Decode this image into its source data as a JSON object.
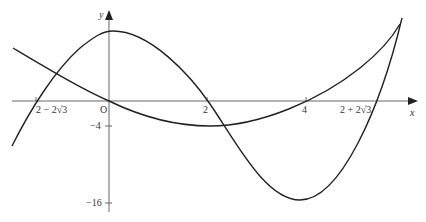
{
  "axes": {
    "x_label": "x",
    "y_label": "y",
    "origin_label": "O",
    "x_ticks": [
      {
        "label": "2 − 2√3",
        "value": -1.464
      },
      {
        "label": "2",
        "value": 2
      },
      {
        "label": "4",
        "value": 4
      },
      {
        "label": "2 + 2√3",
        "value": 5.464
      }
    ],
    "y_ticks": [
      {
        "label": "−4",
        "value": -4
      },
      {
        "label": "−16",
        "value": -16
      }
    ]
  },
  "curves": [
    {
      "name": "cubic",
      "equation": "y = x³ − 6x² + 16 (shape)",
      "max": [
        0,
        "top"
      ],
      "min": [
        4,
        -16
      ]
    },
    {
      "name": "parabola",
      "equation": "y = x(x − 4)",
      "min": [
        2,
        -4
      ]
    }
  ],
  "colors": {
    "curve": "#222222",
    "axis": "#555555",
    "background": "#ffffff"
  }
}
